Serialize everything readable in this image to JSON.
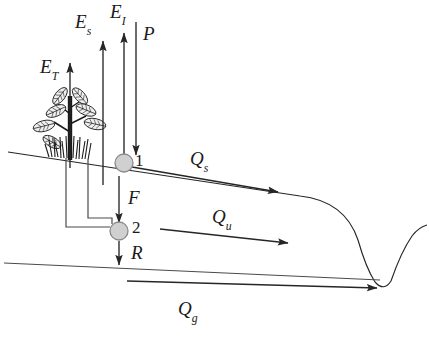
{
  "diagram": {
    "background_color": "#ffffff",
    "line_color": "#262626",
    "node_fill_color": "#d0d0d0",
    "node_stroke_color": "#8a8a8a",
    "labels": {
      "transpiration": {
        "base": "E",
        "sub": "T",
        "x": 40,
        "y": 57
      },
      "soil_evaporation": {
        "base": "E",
        "sub": "s",
        "x": 75,
        "y": 12
      },
      "interception_evaporation": {
        "base": "E",
        "sub": "I",
        "x": 110,
        "y": 2
      },
      "precipitation": {
        "base": "P",
        "sub": "",
        "x": 143,
        "y": 24
      },
      "infiltration": {
        "base": "F",
        "sub": "",
        "x": 128,
        "y": 188
      },
      "recharge": {
        "base": "R",
        "sub": "",
        "x": 131,
        "y": 243
      },
      "surface_runoff": {
        "base": "Q",
        "sub": "s",
        "x": 190,
        "y": 149
      },
      "unsaturated_flow": {
        "base": "Q",
        "sub": "u",
        "x": 212,
        "y": 207
      },
      "groundwater_flow": {
        "base": "Q",
        "sub": "g",
        "x": 178,
        "y": 299
      },
      "node_one": {
        "base": "1",
        "sub": "",
        "x": 135,
        "y": 152
      },
      "node_two": {
        "base": "2",
        "sub": "",
        "x": 132,
        "y": 219
      }
    },
    "nodes": [
      {
        "name": "surface-store-node",
        "label": "1",
        "cx": 124,
        "cy": 163,
        "r": 9
      },
      {
        "name": "subsurface-store-node",
        "label": "2",
        "cx": 119,
        "cy": 231,
        "r": 9
      }
    ],
    "flux_arrows": [
      {
        "name": "transpiration-arrow",
        "label": "E_T",
        "direction": "up"
      },
      {
        "name": "soil-evaporation-arrow",
        "label": "E_s",
        "direction": "up"
      },
      {
        "name": "interception-evaporation-arrow",
        "label": "E_I",
        "direction": "up"
      },
      {
        "name": "precipitation-arrow",
        "label": "P",
        "direction": "down"
      },
      {
        "name": "infiltration-arrow",
        "label": "F",
        "direction": "down"
      },
      {
        "name": "recharge-arrow",
        "label": "R",
        "direction": "down"
      },
      {
        "name": "surface-runoff-arrow",
        "label": "Q_s",
        "direction": "right-down"
      },
      {
        "name": "unsaturated-flow-arrow",
        "label": "Q_u",
        "direction": "right"
      },
      {
        "name": "groundwater-flow-arrow",
        "label": "Q_g",
        "direction": "right"
      }
    ],
    "surfaces": [
      {
        "name": "ground-surface-line"
      },
      {
        "name": "water-table-line"
      },
      {
        "name": "stream-channel-profile"
      }
    ],
    "vegetation": {
      "name": "plant",
      "trunk_color": "#1a1a1a",
      "leaf_count": 7
    }
  }
}
